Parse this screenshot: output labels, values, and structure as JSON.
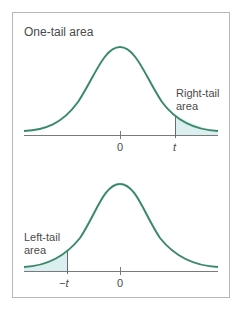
{
  "top_panel": {
    "title": "One-tail area",
    "tail_label_line1": "Right-tail",
    "tail_label_line2": "area",
    "tick_zero": "0",
    "tick_t": "t"
  },
  "bottom_panel": {
    "tail_label_line1": "Left-tail",
    "tail_label_line2": "area",
    "tick_zero": "0",
    "tick_neg_t": "−t"
  },
  "colors": {
    "curve": "#3a8a6a",
    "shade": "#dceff0",
    "axis": "#6a6a6a",
    "frame": "#b8b8b8"
  }
}
